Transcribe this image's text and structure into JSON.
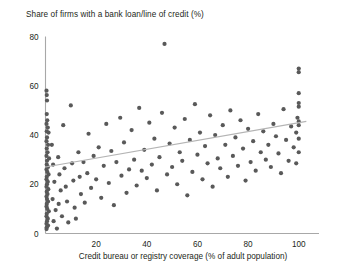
{
  "chart_data": {
    "type": "scatter",
    "title": "Share of firms with a bank loan/line of credit (%)",
    "xlabel": "Credit bureau or registry coverage (% of adult population)",
    "ylabel": "",
    "xlim": [
      0,
      108
    ],
    "ylim": [
      0,
      80
    ],
    "xticks": [
      20,
      40,
      60,
      80,
      100
    ],
    "yticks": [
      0,
      20,
      40,
      60,
      80
    ],
    "xtick_labels": [
      "20",
      "40",
      "60",
      "80",
      "100"
    ],
    "ytick_labels": [
      "0",
      "20",
      "40",
      "60",
      "80"
    ],
    "grid": false,
    "legend": null,
    "series": [
      {
        "name": "Countries",
        "marker": "circle",
        "color": "#595959",
        "points": [
          [
            0.4,
            58.0
          ],
          [
            0.5,
            56.2
          ],
          [
            0.6,
            54.0
          ],
          [
            0.5,
            48.5
          ],
          [
            0.7,
            46.0
          ],
          [
            0.4,
            44.5
          ],
          [
            0.9,
            43.0
          ],
          [
            0.5,
            41.5
          ],
          [
            1.2,
            41.0
          ],
          [
            0.6,
            39.0
          ],
          [
            0.4,
            37.5
          ],
          [
            1.0,
            36.0
          ],
          [
            0.5,
            34.5
          ],
          [
            0.8,
            33.0
          ],
          [
            0.4,
            31.5
          ],
          [
            1.4,
            30.5
          ],
          [
            0.6,
            29.5
          ],
          [
            0.5,
            28.0
          ],
          [
            1.0,
            27.0
          ],
          [
            0.4,
            26.0
          ],
          [
            0.7,
            25.0
          ],
          [
            1.2,
            24.0
          ],
          [
            0.5,
            23.0
          ],
          [
            0.4,
            22.0
          ],
          [
            0.9,
            21.0
          ],
          [
            0.6,
            20.0
          ],
          [
            0.4,
            19.0
          ],
          [
            1.1,
            18.0
          ],
          [
            0.5,
            17.0
          ],
          [
            0.8,
            16.0
          ],
          [
            0.4,
            15.0
          ],
          [
            0.6,
            14.0
          ],
          [
            1.0,
            13.0
          ],
          [
            0.5,
            12.0
          ],
          [
            0.4,
            11.0
          ],
          [
            0.7,
            10.0
          ],
          [
            1.3,
            9.0
          ],
          [
            0.5,
            8.0
          ],
          [
            0.4,
            7.0
          ],
          [
            0.9,
            6.0
          ],
          [
            0.6,
            5.0
          ],
          [
            0.4,
            4.0
          ],
          [
            1.0,
            3.2
          ],
          [
            0.5,
            2.5
          ],
          [
            0.4,
            1.8
          ],
          [
            2.5,
            36.0
          ],
          [
            3.0,
            28.0
          ],
          [
            3.5,
            21.0
          ],
          [
            2.8,
            14.0
          ],
          [
            4.0,
            9.5
          ],
          [
            3.2,
            5.0
          ],
          [
            4.5,
            2.0
          ],
          [
            5.0,
            31.0
          ],
          [
            5.5,
            24.0
          ],
          [
            6.0,
            17.5
          ],
          [
            5.2,
            12.0
          ],
          [
            6.5,
            7.0
          ],
          [
            7.0,
            44.0
          ],
          [
            7.5,
            26.5
          ],
          [
            8.0,
            19.0
          ],
          [
            8.5,
            13.0
          ],
          [
            9.0,
            4.5
          ],
          [
            10.0,
            52.0
          ],
          [
            10.5,
            28.5
          ],
          [
            11.0,
            21.5
          ],
          [
            11.5,
            10.5
          ],
          [
            12.0,
            6.0
          ],
          [
            13.0,
            33.0
          ],
          [
            13.5,
            23.0
          ],
          [
            14.0,
            16.0
          ],
          [
            15.0,
            29.0
          ],
          [
            15.5,
            12.5
          ],
          [
            16.5,
            24.5
          ],
          [
            17.0,
            40.5
          ],
          [
            18.0,
            18.5
          ],
          [
            19.0,
            31.5
          ],
          [
            20.0,
            22.0
          ],
          [
            21.0,
            35.0
          ],
          [
            22.0,
            14.5
          ],
          [
            23.0,
            27.5
          ],
          [
            24.0,
            44.5
          ],
          [
            25.0,
            20.5
          ],
          [
            26.0,
            33.5
          ],
          [
            27.0,
            11.5
          ],
          [
            28.0,
            29.0
          ],
          [
            29.5,
            47.0
          ],
          [
            30.0,
            23.5
          ],
          [
            31.0,
            37.0
          ],
          [
            32.0,
            16.5
          ],
          [
            33.0,
            26.0
          ],
          [
            34.0,
            42.0
          ],
          [
            35.0,
            30.0
          ],
          [
            36.0,
            19.5
          ],
          [
            37.0,
            51.0
          ],
          [
            38.0,
            25.5
          ],
          [
            39.0,
            34.0
          ],
          [
            40.0,
            22.5
          ],
          [
            41.0,
            45.0
          ],
          [
            42.0,
            28.0
          ],
          [
            43.0,
            38.5
          ],
          [
            44.0,
            17.5
          ],
          [
            45.0,
            31.0
          ],
          [
            46.0,
            49.0
          ],
          [
            47.0,
            77.0
          ],
          [
            48.0,
            24.0
          ],
          [
            49.0,
            36.5
          ],
          [
            50.0,
            27.0
          ],
          [
            51.0,
            43.0
          ],
          [
            52.0,
            20.0
          ],
          [
            53.0,
            33.0
          ],
          [
            54.0,
            29.5
          ],
          [
            55.0,
            46.5
          ],
          [
            56.0,
            15.5
          ],
          [
            57.0,
            38.0
          ],
          [
            58.0,
            25.0
          ],
          [
            59.0,
            52.5
          ],
          [
            60.0,
            32.0
          ],
          [
            61.0,
            41.0
          ],
          [
            62.0,
            22.0
          ],
          [
            63.0,
            35.5
          ],
          [
            64.0,
            28.5
          ],
          [
            65.0,
            48.0
          ],
          [
            66.0,
            19.0
          ],
          [
            67.0,
            40.0
          ],
          [
            68.0,
            30.5
          ],
          [
            69.0,
            26.5
          ],
          [
            70.0,
            44.0
          ],
          [
            71.0,
            36.0
          ],
          [
            72.0,
            23.0
          ],
          [
            73.0,
            50.0
          ],
          [
            74.0,
            31.5
          ],
          [
            75.0,
            39.0
          ],
          [
            76.0,
            27.5
          ],
          [
            77.0,
            46.0
          ],
          [
            78.0,
            34.5
          ],
          [
            79.0,
            21.5
          ],
          [
            80.0,
            42.5
          ],
          [
            81.0,
            29.0
          ],
          [
            82.0,
            37.5
          ],
          [
            83.0,
            25.5
          ],
          [
            84.0,
            48.5
          ],
          [
            85.0,
            33.0
          ],
          [
            86.0,
            41.5
          ],
          [
            87.0,
            30.0
          ],
          [
            88.0,
            36.0
          ],
          [
            89.0,
            27.0
          ],
          [
            90.0,
            44.5
          ],
          [
            91.0,
            39.5
          ],
          [
            92.0,
            32.5
          ],
          [
            93.0,
            24.5
          ],
          [
            94.0,
            50.5
          ],
          [
            95.0,
            38.0
          ],
          [
            96.0,
            29.5
          ],
          [
            97.0,
            43.5
          ],
          [
            98.0,
            35.0
          ],
          [
            100.0,
            67.0
          ],
          [
            100.0,
            65.5
          ],
          [
            100.0,
            57.0
          ],
          [
            100.0,
            53.0
          ],
          [
            100.0,
            51.5
          ],
          [
            100.0,
            45.5
          ],
          [
            100.0,
            44.0
          ],
          [
            100.0,
            38.5
          ],
          [
            100.0,
            33.0
          ],
          [
            99.0,
            41.0
          ],
          [
            99.5,
            47.0
          ],
          [
            99.0,
            28.5
          ]
        ]
      }
    ],
    "trendline": {
      "name": "Linear fit",
      "color": "#b4b4b4",
      "x_start": 0,
      "y_start": 27.0,
      "x_end": 103,
      "y_end": 45.5
    }
  }
}
